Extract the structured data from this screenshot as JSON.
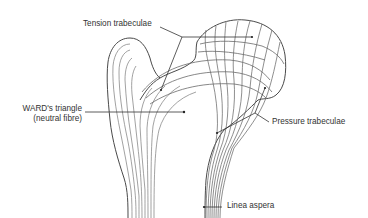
{
  "figure": {
    "labels": {
      "tension": "Tension trabeculae",
      "ward_line1": "WARD's triangle",
      "ward_line2": "(neutral fibre)",
      "pressure": "Pressure trabeculae",
      "linea": "Linea aspera"
    },
    "colors": {
      "outline": "#4a4a4a",
      "trabeculae": "#7a7a7a",
      "leader": "#333333",
      "text": "#333333",
      "background": "#ffffff"
    }
  }
}
